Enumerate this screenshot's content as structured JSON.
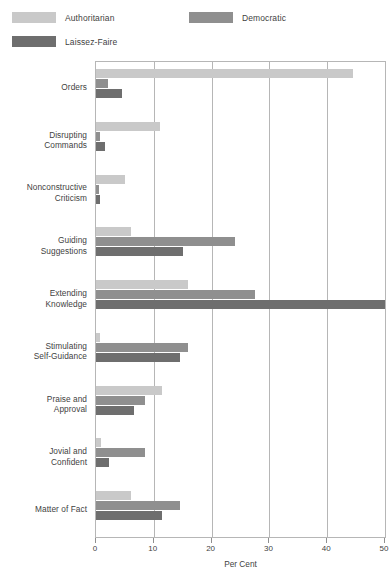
{
  "legend": {
    "position": "top-left",
    "items": [
      {
        "label": "Authoritarian",
        "color": "#c9c9c9"
      },
      {
        "label": "Democratic",
        "color": "#8f8f8f"
      },
      {
        "label": "Laissez-Faire",
        "color": "#6e6e6e"
      }
    ]
  },
  "chart_data": {
    "type": "bar",
    "orientation": "horizontal",
    "title": "",
    "subtitle": "",
    "xlabel": "Per Cent",
    "ylabel": "",
    "xlim": [
      0,
      50
    ],
    "ylim": null,
    "xticks": [
      0,
      10,
      20,
      30,
      40,
      50
    ],
    "xticklabels": [
      "0",
      "10",
      "20",
      "30",
      "40",
      "50"
    ],
    "grid": true,
    "grid_axis": "x",
    "legend_position": "above-plot-left",
    "categories": [
      "Orders",
      "Disrupting\nCommands",
      "Nonconstructive\nCriticism",
      "Guiding\nSuggestions",
      "Extending\nKnowledge",
      "Stimulating\nSelf-Guidance",
      "Praise and\nApproval",
      "Jovial and\nConfident",
      "Matter of Fact"
    ],
    "category_lines": [
      [
        "Orders"
      ],
      [
        "Disrupting",
        "Commands"
      ],
      [
        "Nonconstructive",
        "Criticism"
      ],
      [
        "Guiding",
        "Suggestions"
      ],
      [
        "Extending",
        "Knowledge"
      ],
      [
        "Stimulating",
        "Self-Guidance"
      ],
      [
        "Praise and",
        "Approval"
      ],
      [
        "Jovial and",
        "Confident"
      ],
      [
        "Matter of Fact"
      ]
    ],
    "series": [
      {
        "name": "Authoritarian",
        "color": "#c9c9c9",
        "values": [
          44.5,
          11.0,
          5.0,
          6.0,
          16.0,
          0.7,
          11.5,
          0.8,
          6.0
        ]
      },
      {
        "name": "Democratic",
        "color": "#8f8f8f",
        "values": [
          2.0,
          0.7,
          0.6,
          24.0,
          27.5,
          16.0,
          8.5,
          8.5,
          14.5
        ]
      },
      {
        "name": "Laissez-Faire",
        "color": "#6e6e6e",
        "values": [
          4.5,
          1.5,
          0.7,
          15.0,
          50.0,
          14.5,
          6.5,
          2.3,
          11.5
        ]
      }
    ]
  }
}
